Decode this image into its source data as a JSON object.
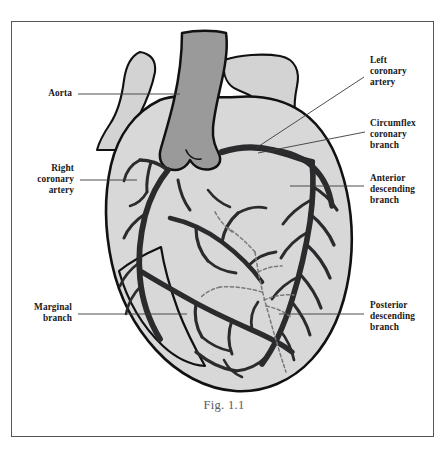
{
  "figure": {
    "caption": "Fig. 1.1",
    "border_color": "#55565a",
    "background_color": "#ffffff"
  },
  "colors": {
    "heart_muscle_fill": "#d8d8d8",
    "aorta_fill": "#9a9a9a",
    "vessel_stub_fill": "#d3d3d3",
    "artery_stroke": "#2b2b2d",
    "outline_stroke": "#111113",
    "hidden_vessel_stroke": "#7a7a7c",
    "leader_line": "#3a3a3c",
    "label_text": "#19191b",
    "caption_text": "#5a5a5c"
  },
  "labels": [
    {
      "id": "aorta",
      "lines": [
        "Aorta"
      ],
      "side": "left",
      "x": 26,
      "y": 88,
      "leader": {
        "x1": 78,
        "y1": 94,
        "x2": 180,
        "y2": 94
      }
    },
    {
      "id": "right-coronary-artery",
      "lines": [
        "Right",
        "coronary",
        "artery"
      ],
      "side": "left",
      "x": 19,
      "y": 163,
      "leader": {
        "x1": 80,
        "y1": 180,
        "x2": 137,
        "y2": 180
      }
    },
    {
      "id": "marginal-branch",
      "lines": [
        "Marginal",
        "branch"
      ],
      "side": "left",
      "x": 23,
      "y": 302,
      "leader": {
        "x1": 78,
        "y1": 314,
        "x2": 187,
        "y2": 314
      }
    },
    {
      "id": "left-coronary-artery",
      "lines": [
        "Left",
        "coronary",
        "artery"
      ],
      "side": "right",
      "x": 370,
      "y": 55,
      "leader": {
        "x1": 364,
        "y1": 77,
        "x2": 256,
        "y2": 148
      }
    },
    {
      "id": "circumflex-coronary-branch",
      "lines": [
        "Circumflex",
        "coronary",
        "branch"
      ],
      "side": "right",
      "x": 370,
      "y": 118,
      "leader": {
        "x1": 365,
        "y1": 132,
        "x2": 258,
        "y2": 153
      }
    },
    {
      "id": "anterior-descending-branch",
      "lines": [
        "Anterior",
        "descending",
        "branch"
      ],
      "side": "right",
      "x": 370,
      "y": 173,
      "leader": {
        "x1": 364,
        "y1": 186,
        "x2": 290,
        "y2": 186
      }
    },
    {
      "id": "posterior-descending-branch",
      "lines": [
        "Posterior",
        "descending",
        "branch"
      ],
      "side": "right",
      "x": 370,
      "y": 300,
      "leader": {
        "x1": 364,
        "y1": 314,
        "x2": 279,
        "y2": 314
      }
    }
  ]
}
